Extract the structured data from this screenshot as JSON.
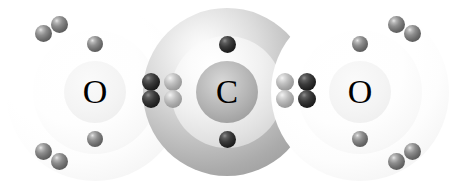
{
  "diagram": {
    "formula": "CO2",
    "background_color": "#ffffff",
    "width": 454,
    "height": 183
  },
  "atoms": [
    {
      "id": "oxygen-left",
      "symbol": "O",
      "name": "oxygen",
      "cx": 95,
      "cy": 92,
      "label_size": 34,
      "shells": [
        {
          "name": "outer-shell",
          "r": 89
        },
        {
          "name": "middle-shell",
          "r": 62
        },
        {
          "name": "core",
          "r": 31
        }
      ]
    },
    {
      "id": "carbon-center",
      "symbol": "C",
      "name": "carbon",
      "cx": 227,
      "cy": 92,
      "label_size": 33,
      "shells": [
        {
          "name": "outer-shell",
          "r": 84
        },
        {
          "name": "middle-shell",
          "r": 56
        },
        {
          "name": "core",
          "r": 31
        }
      ]
    },
    {
      "id": "oxygen-right",
      "symbol": "O",
      "name": "oxygen",
      "cx": 360,
      "cy": 92,
      "label_size": 34,
      "shells": [
        {
          "name": "outer-shell",
          "r": 89
        },
        {
          "name": "middle-shell",
          "r": 62
        },
        {
          "name": "core",
          "r": 31
        }
      ]
    }
  ],
  "electrons": [
    {
      "name": "oxygen-left-inner-electron-top",
      "cx": 95,
      "cy": 44,
      "r": 8,
      "shade": "e-mid"
    },
    {
      "name": "oxygen-left-inner-electron-bottom",
      "cx": 95,
      "cy": 139,
      "r": 8,
      "shade": "e-mid"
    },
    {
      "name": "oxygen-left-lone-pair-upper-outer",
      "cx": 43,
      "cy": 33,
      "r": 8.5,
      "shade": "e-mid"
    },
    {
      "name": "oxygen-left-lone-pair-upper-inner",
      "cx": 59,
      "cy": 24,
      "r": 8.5,
      "shade": "e-mid"
    },
    {
      "name": "oxygen-left-lone-pair-lower-outer",
      "cx": 43,
      "cy": 151,
      "r": 8.5,
      "shade": "e-mid"
    },
    {
      "name": "oxygen-left-lone-pair-lower-inner",
      "cx": 59,
      "cy": 161,
      "r": 8.5,
      "shade": "e-mid"
    },
    {
      "name": "carbon-inner-electron-top",
      "cx": 227,
      "cy": 44,
      "r": 8.5,
      "shade": "e-dark"
    },
    {
      "name": "carbon-inner-electron-bottom",
      "cx": 227,
      "cy": 139,
      "r": 8.5,
      "shade": "e-dark"
    },
    {
      "name": "bond-left-oxygen-electron-top",
      "cx": 151,
      "cy": 82,
      "r": 9,
      "shade": "e-dark"
    },
    {
      "name": "bond-left-oxygen-electron-bottom",
      "cx": 151,
      "cy": 99,
      "r": 9,
      "shade": "e-dark"
    },
    {
      "name": "bond-left-carbon-electron-top",
      "cx": 173,
      "cy": 82,
      "r": 9,
      "shade": "e-light"
    },
    {
      "name": "bond-left-carbon-electron-bottom",
      "cx": 173,
      "cy": 99,
      "r": 9,
      "shade": "e-light"
    },
    {
      "name": "bond-right-carbon-electron-top",
      "cx": 285,
      "cy": 82,
      "r": 9,
      "shade": "e-light"
    },
    {
      "name": "bond-right-carbon-electron-bottom",
      "cx": 285,
      "cy": 99,
      "r": 9,
      "shade": "e-light"
    },
    {
      "name": "bond-right-oxygen-electron-top",
      "cx": 307,
      "cy": 82,
      "r": 9,
      "shade": "e-dark"
    },
    {
      "name": "bond-right-oxygen-electron-bottom",
      "cx": 307,
      "cy": 99,
      "r": 9,
      "shade": "e-dark"
    },
    {
      "name": "oxygen-right-inner-electron-top",
      "cx": 360,
      "cy": 44,
      "r": 8,
      "shade": "e-mid"
    },
    {
      "name": "oxygen-right-inner-electron-bottom",
      "cx": 360,
      "cy": 139,
      "r": 8,
      "shade": "e-mid"
    },
    {
      "name": "oxygen-right-lone-pair-upper-inner",
      "cx": 396,
      "cy": 24,
      "r": 8.5,
      "shade": "e-mid"
    },
    {
      "name": "oxygen-right-lone-pair-upper-outer",
      "cx": 412,
      "cy": 33,
      "r": 8.5,
      "shade": "e-mid"
    },
    {
      "name": "oxygen-right-lone-pair-lower-inner",
      "cx": 396,
      "cy": 161,
      "r": 8.5,
      "shade": "e-mid"
    },
    {
      "name": "oxygen-right-lone-pair-lower-outer",
      "cx": 412,
      "cy": 151,
      "r": 8.5,
      "shade": "e-mid"
    }
  ],
  "colors": {
    "background": "#ffffff",
    "label_text": "#000000",
    "electron_dark": "#1b1b1b",
    "electron_mid": "#6e6e6e",
    "electron_light": "#a6a6a6",
    "carbon_shell": "#a8a8a8",
    "oxygen_shell": "#f3f3f3"
  }
}
